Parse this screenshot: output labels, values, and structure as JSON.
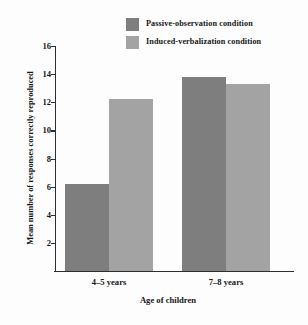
{
  "chart_data": {
    "type": "bar",
    "title": "",
    "xlabel": "Age of children",
    "ylabel": "Mean number of responses correctly reproduced",
    "categories": [
      "4–5 years",
      "7–8 years"
    ],
    "series": [
      {
        "name": "Passive-observation condition",
        "color": "#7e7e7e",
        "values": [
          6.2,
          13.8
        ]
      },
      {
        "name": "Induced-verbalization condition",
        "color": "#a3a3a3",
        "values": [
          12.2,
          13.3
        ]
      }
    ],
    "ylim": [
      0,
      16
    ],
    "ytick_values": [
      2,
      4,
      6,
      8,
      10,
      12,
      14,
      16
    ],
    "ytick_labels": [
      "2",
      "4",
      "6",
      "8",
      "10",
      "12",
      "14",
      "16"
    ],
    "grid": false,
    "legend_position": "top-right",
    "background_color": "#fdfdfd",
    "axis_color": "#2e2e2e"
  },
  "legend": {
    "items": [
      {
        "label": "Passive-observation condition",
        "swatch": "legend-swatch-dark"
      },
      {
        "label": "Induced-verbalization condition",
        "swatch": "legend-swatch-light"
      }
    ]
  }
}
